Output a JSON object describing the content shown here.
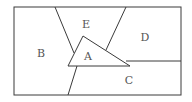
{
  "diagram": {
    "stroke_color": "#3a3a3a",
    "label_color": "#555555",
    "regions": [
      {
        "id": "A",
        "label": "A",
        "x": 88,
        "y": 60
      },
      {
        "id": "B",
        "label": "B",
        "x": 41,
        "y": 57
      },
      {
        "id": "C",
        "label": "C",
        "x": 129,
        "y": 84
      },
      {
        "id": "D",
        "label": "D",
        "x": 145,
        "y": 41
      },
      {
        "id": "E",
        "label": "E",
        "x": 86,
        "y": 28
      }
    ],
    "border": {
      "x": 14,
      "y": 7,
      "width": 167,
      "height": 88
    },
    "triangle": {
      "points": "83,36 68,66 130,66"
    },
    "lines": [
      {
        "name": "line-b-e-divider",
        "x1": 55,
        "y1": 7,
        "x2": 74,
        "y2": 53
      },
      {
        "name": "line-e-d-divider",
        "x1": 126,
        "y1": 7,
        "x2": 106,
        "y2": 50
      },
      {
        "name": "line-d-c-divider",
        "x1": 126,
        "y1": 61,
        "x2": 181,
        "y2": 61
      },
      {
        "name": "line-b-c-divider",
        "x1": 77,
        "y1": 66,
        "x2": 68,
        "y2": 95
      }
    ]
  }
}
